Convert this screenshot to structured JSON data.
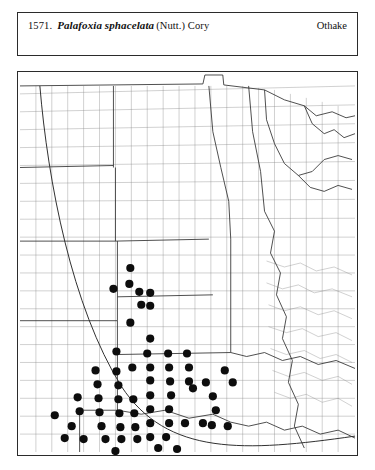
{
  "header": {
    "entry_number": "1571.",
    "scientific_name": "Palafoxia sphacelata",
    "authority": "(Nutt.) Cory",
    "common_name": "Othake"
  },
  "map": {
    "type": "county-dot-distribution-map",
    "region": "Great Plains and central United States",
    "dot_color": "#0d0d0d",
    "line_color": "#6e6e6e",
    "state_line_color": "#3a3a3a",
    "frame_color": "#2b2b2b",
    "dot_count": 78,
    "dot_radius_px": 4.1,
    "occurrence_dots": [
      [
        113,
        197
      ],
      [
        112,
        213
      ],
      [
        96,
        218
      ],
      [
        122,
        221
      ],
      [
        133,
        222
      ],
      [
        124,
        234
      ],
      [
        133,
        235
      ],
      [
        113,
        252
      ],
      [
        133,
        268
      ],
      [
        99,
        281
      ],
      [
        130,
        283
      ],
      [
        151,
        283
      ],
      [
        170,
        283
      ],
      [
        115,
        297
      ],
      [
        133,
        297
      ],
      [
        152,
        297
      ],
      [
        172,
        297
      ],
      [
        78,
        300
      ],
      [
        99,
        301
      ],
      [
        133,
        310
      ],
      [
        153,
        311
      ],
      [
        172,
        311
      ],
      [
        80,
        314
      ],
      [
        101,
        315
      ],
      [
        133,
        325
      ],
      [
        154,
        325
      ],
      [
        60,
        327
      ],
      [
        81,
        328
      ],
      [
        101,
        329
      ],
      [
        116,
        329
      ],
      [
        133,
        339
      ],
      [
        62,
        341
      ],
      [
        82,
        342
      ],
      [
        102,
        343
      ],
      [
        117,
        343
      ],
      [
        37,
        345
      ],
      [
        84,
        356
      ],
      [
        103,
        357
      ],
      [
        118,
        357
      ],
      [
        133,
        353
      ],
      [
        176,
        318
      ],
      [
        189,
        312
      ],
      [
        196,
        326
      ],
      [
        199,
        340
      ],
      [
        208,
        300
      ],
      [
        216,
        312
      ],
      [
        152,
        339
      ],
      [
        152,
        353
      ],
      [
        168,
        353
      ],
      [
        186,
        353
      ],
      [
        66,
        369
      ],
      [
        88,
        369
      ],
      [
        104,
        369
      ],
      [
        120,
        369
      ],
      [
        98,
        381
      ],
      [
        133,
        367
      ],
      [
        149,
        367
      ],
      [
        195,
        355
      ],
      [
        211,
        356
      ],
      [
        141,
        378
      ],
      [
        160,
        379
      ],
      [
        54,
        356
      ],
      [
        47,
        368
      ]
    ],
    "reference_arc": {
      "description": "curved range-boundary arc sweeping from upper-left down through the lower-right",
      "color": "#3a3a3a"
    }
  }
}
